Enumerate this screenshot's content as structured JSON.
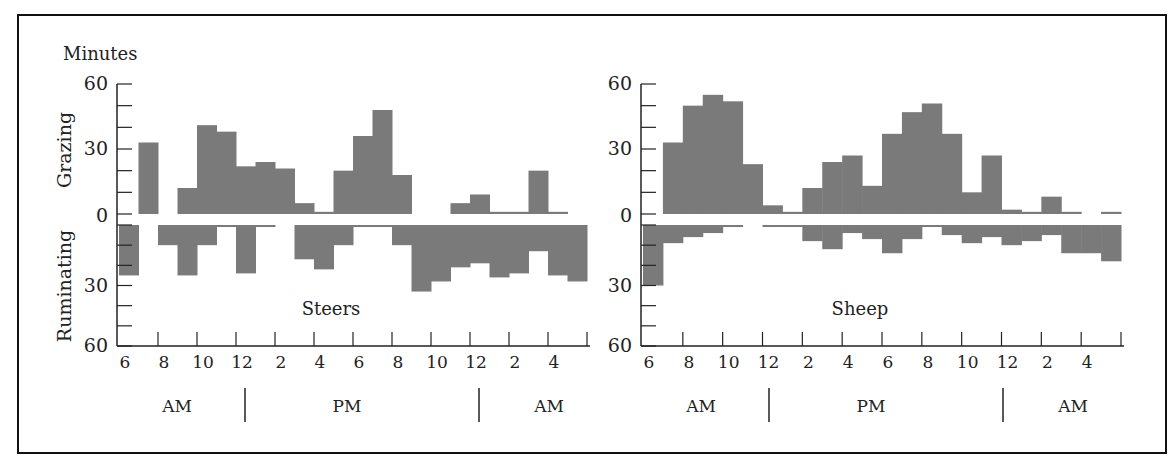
{
  "figure": {
    "y_unit_label": "Minutes",
    "upper_label": "Grazing",
    "lower_label": "Ruminating",
    "bar_color": "#7a7a7a",
    "axis_color": "#222222"
  },
  "chart_data": [
    {
      "type": "bar",
      "title": "Steers",
      "ylabel_top": "Grazing",
      "ylabel_bottom": "Ruminating",
      "yunit": "Minutes",
      "ylim_top": [
        0,
        60
      ],
      "ylim_bottom": [
        0,
        60
      ],
      "ytick_labels": [
        "60",
        "30",
        "0",
        "30",
        "60"
      ],
      "xtick_labels": [
        "6",
        "8",
        "10",
        "12",
        "2",
        "4",
        "6",
        "8",
        "10",
        "12",
        "2",
        "4"
      ],
      "period_labels": [
        "AM",
        "PM",
        "AM"
      ],
      "hours": [
        "6",
        "7",
        "8",
        "9",
        "10",
        "11",
        "12",
        "1",
        "2",
        "3",
        "4",
        "5",
        "6",
        "7",
        "8",
        "9",
        "10",
        "11",
        "12",
        "1",
        "2",
        "3",
        "4",
        "5"
      ],
      "series": [
        {
          "name": "Grazing",
          "values": [
            0,
            33,
            0,
            12,
            41,
            38,
            22,
            24,
            21,
            5,
            1,
            20,
            36,
            48,
            18,
            0,
            0,
            5,
            9,
            1,
            1,
            20,
            1,
            0
          ]
        },
        {
          "name": "Ruminating",
          "values": [
            25,
            0,
            10,
            25,
            10,
            1,
            24,
            1,
            0,
            17,
            22,
            10,
            1,
            1,
            10,
            33,
            28,
            21,
            19,
            26,
            24,
            13,
            25,
            28
          ]
        }
      ]
    },
    {
      "type": "bar",
      "title": "Sheep",
      "ylabel_top": "Grazing",
      "ylabel_bottom": "Ruminating",
      "ylim_top": [
        0,
        60
      ],
      "ylim_bottom": [
        0,
        60
      ],
      "ytick_labels": [
        "60",
        "30",
        "0",
        "30",
        "60"
      ],
      "xtick_labels": [
        "6",
        "8",
        "10",
        "12",
        "2",
        "4",
        "6",
        "8",
        "10",
        "12",
        "2",
        "4"
      ],
      "period_labels": [
        "AM",
        "PM",
        "AM"
      ],
      "hours": [
        "6",
        "7",
        "8",
        "9",
        "10",
        "11",
        "12",
        "1",
        "2",
        "3",
        "4",
        "5",
        "6",
        "7",
        "8",
        "9",
        "10",
        "11",
        "12",
        "1",
        "2",
        "3",
        "4",
        "5"
      ],
      "series": [
        {
          "name": "Grazing",
          "values": [
            0,
            33,
            50,
            55,
            52,
            23,
            4,
            1,
            12,
            24,
            27,
            13,
            37,
            47,
            51,
            37,
            10,
            27,
            2,
            1,
            8,
            1,
            0,
            1
          ]
        },
        {
          "name": "Ruminating",
          "values": [
            30,
            9,
            6,
            4,
            1,
            0,
            1,
            1,
            8,
            12,
            4,
            7,
            14,
            7,
            1,
            5,
            9,
            6,
            10,
            8,
            5,
            14,
            14,
            18
          ]
        }
      ]
    }
  ]
}
